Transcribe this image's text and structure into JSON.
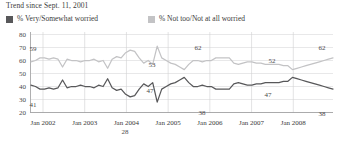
{
  "title": "Trend since Sept. 11, 2001",
  "legend": {
    "items": [
      {
        "label": "% Very/Somewhat worried",
        "color": "#58585a"
      },
      {
        "label": "% Not too/Not at all worried",
        "color": "#c3c3c5"
      }
    ]
  },
  "axis": {
    "y_ticks": [
      "20",
      "30",
      "40",
      "50",
      "60",
      "70",
      "80"
    ],
    "x_ticks": [
      "Jan 2002",
      "Jan 2003",
      "Jan 2004",
      "Jan 2005",
      "Jan 2006",
      "Jan 2007",
      "Jan 2008"
    ]
  },
  "point_labels": [
    {
      "text": "59",
      "x": 33,
      "y": 21
    },
    {
      "text": "41",
      "x": 33,
      "y": 77
    },
    {
      "text": "28",
      "x": 125,
      "y": 104
    },
    {
      "text": "53",
      "x": 152,
      "y": 37
    },
    {
      "text": "47",
      "x": 150,
      "y": 63
    },
    {
      "text": "38",
      "x": 202,
      "y": 85
    },
    {
      "text": "62",
      "x": 198,
      "y": 20
    },
    {
      "text": "52",
      "x": 272,
      "y": 33
    },
    {
      "text": "47",
      "x": 268,
      "y": 67
    },
    {
      "text": "62",
      "x": 322,
      "y": 20
    },
    {
      "text": "38",
      "x": 322,
      "y": 86
    }
  ],
  "chart_data": {
    "type": "line",
    "title": "Trend since Sept. 11, 2001",
    "xlabel": "",
    "ylabel": "",
    "ylim": [
      20,
      80
    ],
    "grid": true,
    "legend_position": "top",
    "x_tick_labels": [
      "Jan 2002",
      "Jan 2003",
      "Jan 2004",
      "Jan 2005",
      "Jan 2006",
      "Jan 2007",
      "Jan 2008"
    ],
    "y_tick_values": [
      20,
      30,
      40,
      50,
      60,
      70,
      80
    ],
    "annotations": [
      "59",
      "41",
      "28",
      "53",
      "47",
      "38",
      "62",
      "52",
      "47",
      "62",
      "38"
    ],
    "series": [
      {
        "name": "% Very/Somewhat worried",
        "color": "#58585a",
        "values": [
          41,
          40,
          38,
          38,
          39,
          38,
          39,
          45,
          39,
          40,
          40,
          41,
          40,
          40,
          39,
          41,
          40,
          46,
          39,
          37,
          38,
          34,
          32,
          33,
          38,
          42,
          40,
          43,
          28,
          38,
          40,
          42,
          43,
          45,
          47,
          43,
          40,
          40,
          41,
          40,
          40,
          38,
          38,
          38,
          38,
          42,
          43,
          42,
          41,
          41,
          42,
          42,
          43,
          43,
          43,
          43,
          44,
          44,
          47,
          46,
          45,
          44,
          43,
          42,
          41,
          40,
          39,
          38
        ]
      },
      {
        "name": "% Not too/Not at all worried",
        "color": "#c3c3c5",
        "values": [
          59,
          60,
          62,
          62,
          61,
          62,
          61,
          55,
          61,
          60,
          60,
          59,
          60,
          60,
          61,
          59,
          60,
          54,
          61,
          63,
          62,
          66,
          68,
          67,
          62,
          58,
          60,
          57,
          71,
          62,
          60,
          58,
          57,
          55,
          53,
          57,
          60,
          60,
          59,
          60,
          60,
          62,
          62,
          62,
          62,
          58,
          57,
          58,
          59,
          59,
          58,
          58,
          57,
          57,
          57,
          57,
          56,
          56,
          53,
          54,
          55,
          56,
          57,
          58,
          59,
          60,
          61,
          62
        ]
      }
    ]
  }
}
